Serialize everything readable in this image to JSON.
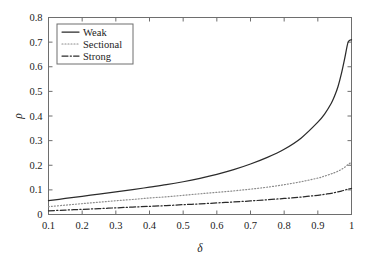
{
  "chart_data": {
    "type": "line",
    "title": "",
    "xlabel": "δ",
    "ylabel": "ρ",
    "xlim": [
      0.1,
      1.0
    ],
    "ylim": [
      0.0,
      0.8
    ],
    "grid": false,
    "legend_position": "top-left",
    "xticks": [
      "0.1",
      "0.2",
      "0.3",
      "0.4",
      "0.5",
      "0.6",
      "0.7",
      "0.8",
      "0.9",
      "1"
    ],
    "xtick_values": [
      0.1,
      0.2,
      0.3,
      0.4,
      0.5,
      0.6,
      0.7,
      0.8,
      0.9,
      1.0
    ],
    "yticks": [
      "0",
      "0.1",
      "0.2",
      "0.3",
      "0.4",
      "0.5",
      "0.6",
      "0.7",
      "0.8"
    ],
    "ytick_values": [
      0,
      0.1,
      0.2,
      0.3,
      0.4,
      0.5,
      0.6,
      0.7,
      0.8
    ],
    "x": [
      0.1,
      0.15,
      0.2,
      0.25,
      0.3,
      0.35,
      0.4,
      0.45,
      0.5,
      0.55,
      0.6,
      0.65,
      0.7,
      0.75,
      0.8,
      0.85,
      0.9,
      0.92,
      0.94,
      0.95,
      0.96,
      0.97,
      0.98,
      0.99,
      1.0
    ],
    "series": [
      {
        "name": "Weak",
        "style": "solid",
        "color": "#2b2b2b",
        "values": [
          0.056,
          0.065,
          0.074,
          0.083,
          0.092,
          0.101,
          0.111,
          0.121,
          0.133,
          0.147,
          0.163,
          0.182,
          0.205,
          0.232,
          0.265,
          0.31,
          0.375,
          0.408,
          0.452,
          0.482,
          0.52,
          0.572,
          0.635,
          0.7,
          0.71
        ]
      },
      {
        "name": "Sectional",
        "style": "dotted",
        "color": "#8c8c8c",
        "values": [
          0.032,
          0.038,
          0.044,
          0.05,
          0.056,
          0.061,
          0.067,
          0.072,
          0.078,
          0.084,
          0.09,
          0.096,
          0.103,
          0.111,
          0.121,
          0.133,
          0.148,
          0.156,
          0.165,
          0.17,
          0.176,
          0.183,
          0.192,
          0.203,
          0.212
        ]
      },
      {
        "name": "Strong",
        "style": "dashdot",
        "color": "#2b2b2b",
        "values": [
          0.015,
          0.018,
          0.021,
          0.024,
          0.027,
          0.03,
          0.033,
          0.036,
          0.04,
          0.043,
          0.047,
          0.051,
          0.055,
          0.06,
          0.065,
          0.071,
          0.078,
          0.082,
          0.086,
          0.089,
          0.092,
          0.095,
          0.099,
          0.103,
          0.106
        ]
      }
    ]
  },
  "legend": {
    "entries": [
      {
        "label": "Weak"
      },
      {
        "label": "Sectional"
      },
      {
        "label": "Strong"
      }
    ]
  }
}
